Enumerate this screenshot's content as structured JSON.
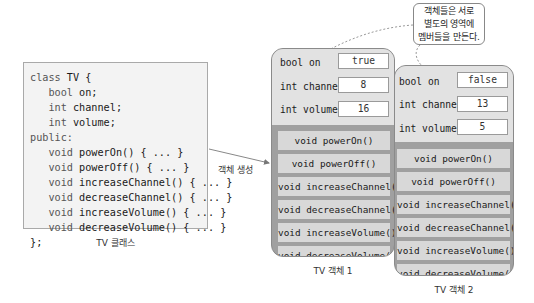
{
  "class_box": {
    "lines": [
      {
        "indent": 0,
        "kw": "class",
        "text": " TV {"
      },
      {
        "indent": 1,
        "kw": "bool",
        "text": " on;"
      },
      {
        "indent": 1,
        "kw": "int",
        "text": " channel;"
      },
      {
        "indent": 1,
        "kw": "int",
        "text": " volume;"
      },
      {
        "indent": 0,
        "kw": "public:",
        "text": ""
      },
      {
        "indent": 1,
        "kw": "void",
        "text": " powerOn() { ... }"
      },
      {
        "indent": 1,
        "kw": "void",
        "text": " powerOff() { ... }"
      },
      {
        "indent": 1,
        "kw": "void",
        "text": " increaseChannel() { ... }"
      },
      {
        "indent": 1,
        "kw": "void",
        "text": " decreaseChannel() { ... }"
      },
      {
        "indent": 1,
        "kw": "void",
        "text": " increaseVolume() { ... }"
      },
      {
        "indent": 1,
        "kw": "void",
        "text": " decreaseVolume() { ... }"
      },
      {
        "indent": 0,
        "kw": "",
        "text": "};"
      }
    ],
    "caption": "TV 클래스"
  },
  "arrow_label": "객체 생성",
  "callout": {
    "lines": [
      "객체들은 서로",
      "별도의 영역에",
      "멤버들을 만든다."
    ]
  },
  "objects": [
    {
      "caption": "TV 객체 1",
      "fields": [
        {
          "label": "bool on",
          "value": "true"
        },
        {
          "label": "int channel",
          "value": "8"
        },
        {
          "label": "int volume",
          "value": "16"
        }
      ],
      "methods": [
        "void powerOn()",
        "void powerOff()",
        "void increaseChannel()",
        "void decreaseChannel()",
        "void increaseVolume()",
        "void decreaseVolume()"
      ]
    },
    {
      "caption": "TV 객체 2",
      "fields": [
        {
          "label": "bool on",
          "value": "false"
        },
        {
          "label": "int channel",
          "value": "13"
        },
        {
          "label": "int volume",
          "value": "5"
        }
      ],
      "methods": [
        "void powerOn()",
        "void powerOff()",
        "void increaseChannel()",
        "void decreaseChannel()",
        "void increaseVolume()",
        "void decreaseVolume()"
      ]
    }
  ]
}
